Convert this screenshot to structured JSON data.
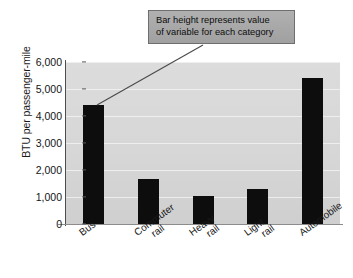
{
  "chart_data": {
    "type": "bar",
    "title": "",
    "xlabel": "",
    "ylabel": "BTU per passenger-mile",
    "categories": [
      "Bus",
      "Commuter rail",
      "Heavy rail",
      "Light rail",
      "Automobile"
    ],
    "category_lines": [
      [
        "Bus"
      ],
      [
        "Commuter",
        "rail"
      ],
      [
        "Heavy",
        "rail"
      ],
      [
        "Light",
        "rail"
      ],
      [
        "Automobile"
      ]
    ],
    "values": [
      4400,
      1650,
      1020,
      1300,
      5400
    ],
    "ylim": [
      0,
      6000
    ],
    "ytick_values": [
      0,
      1000,
      2000,
      3000,
      4000,
      5000,
      6000
    ],
    "ytick_labels": [
      "0",
      "1,000",
      "2,000",
      "3,000",
      "4,000",
      "5,000",
      "6,000"
    ],
    "grid": true,
    "legend": "none",
    "bar_color": "#0d0d0d",
    "plot_background": "#d9d9d9",
    "gridline_color": "#f2f2f2"
  },
  "annotation": {
    "line1": "Bar height represents value",
    "line2": "of variable for each category",
    "box_fill": "#a8a8a8",
    "box_border": "#6e6e6e",
    "leader_color": "#4a4a4a"
  }
}
